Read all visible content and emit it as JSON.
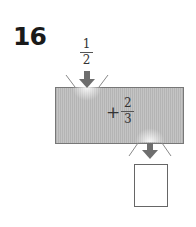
{
  "problem": {
    "number": "16"
  },
  "input": {
    "numerator": "1",
    "denominator": "2"
  },
  "machine": {
    "operator": "+",
    "operand_numerator": "2",
    "operand_denominator": "3",
    "fill_color": "#bcbcbc",
    "arrow_color": "#6e6e6e"
  },
  "output": {
    "value": ""
  },
  "icons": {
    "input_arrow": "down-arrow-icon",
    "output_arrow": "down-arrow-icon"
  }
}
